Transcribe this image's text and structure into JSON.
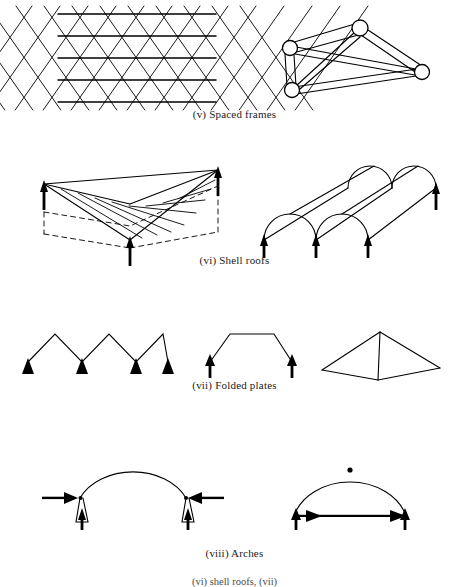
{
  "figure": {
    "type": "structural-systems-illustration-sheet",
    "background_color": "#ffffff",
    "ink_color": "#000000",
    "width": 469,
    "height": 587
  },
  "sections": [
    {
      "id": "spaced-frames",
      "numeral": "(v)",
      "caption": "(v) Spaced frames",
      "caption_y": 108,
      "diagrams": [
        {
          "id": "lattice-grid",
          "name": "diagonal-lattice-grid",
          "description": "Plan of a double-layer space grid: crossing diagonal members with horizontal chord lines",
          "rows": 4,
          "cols": 6
        },
        {
          "id": "space-truss",
          "name": "three-dimensional-space-truss",
          "description": "Tetrahedral space truss with four circular joint nodes and paired-line members",
          "node_count": 4,
          "member_count": 6
        }
      ]
    },
    {
      "id": "shell-roofs",
      "numeral": "(vi)",
      "caption": "(vi) Shell roofs",
      "caption_y": 254,
      "diagrams": [
        {
          "id": "hypar-shell",
          "name": "hyperbolic-paraboloid-shell",
          "description": "Hyperbolic paraboloid shell with dashed ground outline, ruled straight generator lines and three support reactions",
          "support_arrows": 3,
          "arrow_direction": "up",
          "base_outline": "dashed"
        },
        {
          "id": "barrel-vault",
          "name": "double-barrel-vault-shell",
          "description": "Two adjacent cylindrical barrel vault shells in oblique projection with four support reactions",
          "barrel_count": 2,
          "support_arrows": 4,
          "arrow_direction": "up"
        }
      ]
    },
    {
      "id": "folded-plates",
      "numeral": "(vii)",
      "caption": "(vii) Folded plates",
      "caption_y": 379,
      "diagrams": [
        {
          "id": "zigzag-plate",
          "name": "zigzag-folded-plate-section",
          "description": "V-fold (W shaped) folded plate cross-section on four triangular supports",
          "folds": 3,
          "support_arrows": 4
        },
        {
          "id": "trapezoid-plate",
          "name": "trapezoidal-folded-plate-section",
          "description": "Trapezoidal folded plate cross-section on two supports",
          "folds": 2,
          "support_arrows": 2
        },
        {
          "id": "pyramid-plate",
          "name": "pyramidal-folded-plate",
          "description": "Pyramidal folded plate unit shown in three-dimensional view",
          "faces": 3
        }
      ]
    },
    {
      "id": "arches",
      "numeral": "(viii)",
      "caption": "(viii) Arches",
      "caption_y": 547,
      "diagrams": [
        {
          "id": "fixed-arch",
          "name": "fixed-base-arch",
          "description": "Fixed-ended arch with horizontal thrust reactions pointing inward and vertical support reactions",
          "horizontal_arrows": 2,
          "horizontal_direction": "inward",
          "vertical_arrows": 2,
          "hinges": 2
        },
        {
          "id": "tied-arch",
          "name": "three-hinged-tied-arch",
          "description": "Three-hinged arch with crown hinge and horizontal tie rod with arrowheads at both ends",
          "crown_hinge": true,
          "tie_rod": true,
          "vertical_arrows": 2
        }
      ]
    }
  ],
  "footer": {
    "cut_caption": "(vi) shell roofs, (vii)"
  }
}
